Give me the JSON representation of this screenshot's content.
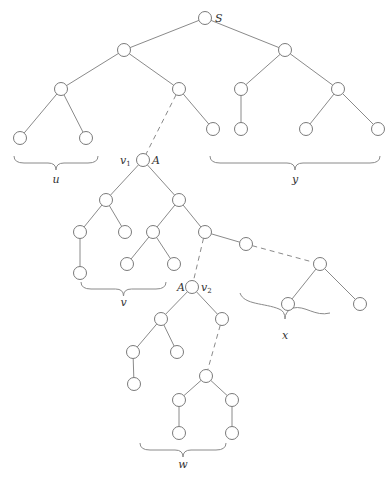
{
  "diagram": {
    "node_radius": 6.5,
    "colors": {
      "stroke": "#7a7a7a",
      "edge": "#8a8a8a",
      "text": "#333333",
      "background": "#ffffff"
    },
    "nodes": [
      {
        "id": "S",
        "x": 205,
        "y": 18
      },
      {
        "id": "L1",
        "x": 124,
        "y": 50
      },
      {
        "id": "R1",
        "x": 285,
        "y": 50
      },
      {
        "id": "LL",
        "x": 61,
        "y": 89
      },
      {
        "id": "LR",
        "x": 179,
        "y": 89
      },
      {
        "id": "RL",
        "x": 241,
        "y": 89
      },
      {
        "id": "RR",
        "x": 338,
        "y": 89
      },
      {
        "id": "LLa",
        "x": 20,
        "y": 138
      },
      {
        "id": "LLb",
        "x": 86,
        "y": 138
      },
      {
        "id": "LRb",
        "x": 213,
        "y": 129
      },
      {
        "id": "RLa",
        "x": 241,
        "y": 129
      },
      {
        "id": "RRa",
        "x": 306,
        "y": 129
      },
      {
        "id": "RRb",
        "x": 378,
        "y": 129
      },
      {
        "id": "v1",
        "x": 143,
        "y": 160
      },
      {
        "id": "a",
        "x": 106,
        "y": 200
      },
      {
        "id": "b",
        "x": 179,
        "y": 200
      },
      {
        "id": "aL",
        "x": 80,
        "y": 232
      },
      {
        "id": "aR",
        "x": 125,
        "y": 232
      },
      {
        "id": "aLL",
        "x": 80,
        "y": 273
      },
      {
        "id": "bL",
        "x": 153,
        "y": 232
      },
      {
        "id": "bR",
        "x": 205,
        "y": 232
      },
      {
        "id": "bLL",
        "x": 127,
        "y": 264
      },
      {
        "id": "bLR",
        "x": 174,
        "y": 264
      },
      {
        "id": "c",
        "x": 246,
        "y": 244
      },
      {
        "id": "d",
        "x": 320,
        "y": 264
      },
      {
        "id": "dL",
        "x": 288,
        "y": 304
      },
      {
        "id": "dR",
        "x": 360,
        "y": 304
      },
      {
        "id": "v2",
        "x": 192,
        "y": 287
      },
      {
        "id": "v2L",
        "x": 161,
        "y": 319
      },
      {
        "id": "v2R",
        "x": 222,
        "y": 319
      },
      {
        "id": "v2LL",
        "x": 133,
        "y": 352
      },
      {
        "id": "v2LR",
        "x": 177,
        "y": 352
      },
      {
        "id": "v2LLL",
        "x": 134,
        "y": 384
      },
      {
        "id": "e",
        "x": 206,
        "y": 376
      },
      {
        "id": "eL",
        "x": 179,
        "y": 400
      },
      {
        "id": "eR",
        "x": 232,
        "y": 400
      },
      {
        "id": "eLL",
        "x": 179,
        "y": 433
      },
      {
        "id": "eRR",
        "x": 232,
        "y": 433
      }
    ],
    "edges": [
      {
        "from": "S",
        "to": "L1",
        "style": "solid"
      },
      {
        "from": "S",
        "to": "R1",
        "style": "solid"
      },
      {
        "from": "L1",
        "to": "LL",
        "style": "solid"
      },
      {
        "from": "L1",
        "to": "LR",
        "style": "solid"
      },
      {
        "from": "R1",
        "to": "RL",
        "style": "solid"
      },
      {
        "from": "R1",
        "to": "RR",
        "style": "solid"
      },
      {
        "from": "LL",
        "to": "LLa",
        "style": "solid"
      },
      {
        "from": "LL",
        "to": "LLb",
        "style": "solid"
      },
      {
        "from": "LR",
        "to": "LRb",
        "style": "solid"
      },
      {
        "from": "LR",
        "to": "v1",
        "style": "dashed"
      },
      {
        "from": "RL",
        "to": "RLa",
        "style": "solid"
      },
      {
        "from": "RR",
        "to": "RRa",
        "style": "solid"
      },
      {
        "from": "RR",
        "to": "RRb",
        "style": "solid"
      },
      {
        "from": "v1",
        "to": "a",
        "style": "solid"
      },
      {
        "from": "v1",
        "to": "b",
        "style": "solid"
      },
      {
        "from": "a",
        "to": "aL",
        "style": "solid"
      },
      {
        "from": "a",
        "to": "aR",
        "style": "solid"
      },
      {
        "from": "aL",
        "to": "aLL",
        "style": "solid"
      },
      {
        "from": "b",
        "to": "bL",
        "style": "solid"
      },
      {
        "from": "b",
        "to": "bR",
        "style": "solid"
      },
      {
        "from": "bL",
        "to": "bLL",
        "style": "solid"
      },
      {
        "from": "bL",
        "to": "bLR",
        "style": "solid"
      },
      {
        "from": "bR",
        "to": "c",
        "style": "solid"
      },
      {
        "from": "c",
        "to": "d",
        "style": "dashed"
      },
      {
        "from": "d",
        "to": "dL",
        "style": "solid"
      },
      {
        "from": "d",
        "to": "dR",
        "style": "solid"
      },
      {
        "from": "bR",
        "to": "v2",
        "style": "dashed"
      },
      {
        "from": "v2",
        "to": "v2L",
        "style": "solid"
      },
      {
        "from": "v2",
        "to": "v2R",
        "style": "solid"
      },
      {
        "from": "v2L",
        "to": "v2LL",
        "style": "solid"
      },
      {
        "from": "v2L",
        "to": "v2LR",
        "style": "solid"
      },
      {
        "from": "v2LL",
        "to": "v2LLL",
        "style": "solid"
      },
      {
        "from": "v2R",
        "to": "e",
        "style": "dashed"
      },
      {
        "from": "e",
        "to": "eL",
        "style": "solid"
      },
      {
        "from": "e",
        "to": "eR",
        "style": "solid"
      },
      {
        "from": "eL",
        "to": "eLL",
        "style": "solid"
      },
      {
        "from": "eR",
        "to": "eRR",
        "style": "solid"
      }
    ],
    "node_labels": [
      {
        "text": "S",
        "x": 215,
        "y": 22,
        "anchor": "start"
      },
      {
        "text": "v",
        "sub": "1",
        "x": 120,
        "y": 164,
        "anchor": "start"
      },
      {
        "text": "A",
        "x": 152,
        "y": 164,
        "anchor": "start"
      },
      {
        "text": "A",
        "x": 177,
        "y": 291,
        "anchor": "start"
      },
      {
        "text": "v",
        "sub": "2",
        "x": 201,
        "y": 291,
        "anchor": "start"
      }
    ],
    "braces": [
      {
        "id": "u",
        "label": "u",
        "x1": 14,
        "x2": 98,
        "y": 156,
        "label_y": 183,
        "flip": false
      },
      {
        "id": "y",
        "label": "y",
        "x1": 210,
        "x2": 380,
        "y": 156,
        "label_y": 183,
        "flip": false
      },
      {
        "id": "v",
        "label": "v",
        "x1": 81,
        "x2": 166,
        "y": 282,
        "label_y": 306,
        "flip": false
      },
      {
        "id": "x",
        "label": "x",
        "x1": 240,
        "x2": 330,
        "y": 293,
        "label_y": 339,
        "flip": false,
        "skew": true
      },
      {
        "id": "w",
        "label": "w",
        "x1": 140,
        "x2": 226,
        "y": 443,
        "label_y": 468,
        "flip": false
      }
    ]
  }
}
